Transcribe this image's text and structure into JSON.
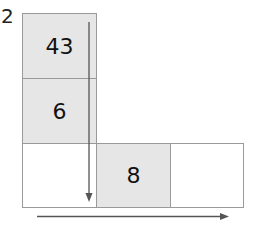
{
  "question_number": "2",
  "cells": [
    {
      "id": "r0c0",
      "value": "43",
      "shaded": true
    },
    {
      "id": "r1c0",
      "value": "6",
      "shaded": true
    },
    {
      "id": "r2c0",
      "value": "",
      "shaded": false
    },
    {
      "id": "r2c1",
      "value": "8",
      "shaded": true
    },
    {
      "id": "r2c2",
      "value": "",
      "shaded": false
    }
  ],
  "arrows": {
    "vertical": "down-arrow",
    "horizontal": "right-arrow"
  },
  "colors": {
    "shaded": "#e6e6e6",
    "border": "#9a9a9a",
    "arrow": "#555555"
  }
}
